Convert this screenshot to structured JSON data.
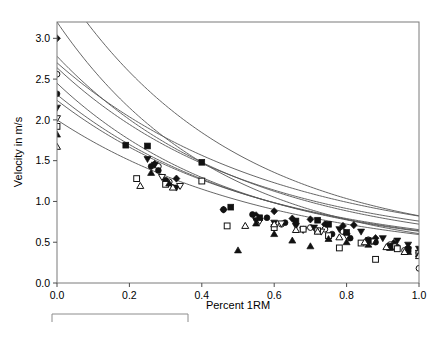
{
  "chart_data": {
    "type": "scatter",
    "title": "",
    "xlabel": "Percent 1RM",
    "ylabel": "Velocity in m/s",
    "xlim": [
      0.0,
      1.0
    ],
    "ylim": [
      0.0,
      3.2
    ],
    "xticks": [
      "0.0",
      "0.2",
      "0.4",
      "0.6",
      "0.8",
      "1.0"
    ],
    "xtick_values": [
      0.0,
      0.2,
      0.4,
      0.6,
      0.8,
      1.0
    ],
    "yticks": [
      "0.0",
      "0.5",
      "1.0",
      "1.5",
      "2.0",
      "2.5",
      "3.0"
    ],
    "ytick_values": [
      0.0,
      0.5,
      1.0,
      1.5,
      2.0,
      2.5,
      3.0
    ],
    "grid": false,
    "legend_position": "none",
    "legend_box_empty": true,
    "marker_color": "#111111",
    "curve_color": "#555555",
    "frame_color": "#7a7a7a",
    "series": [
      {
        "name": "Series 1",
        "marker": "filled-diamond",
        "fit": {
          "form": "exponential",
          "a": 3.3,
          "b": 2.1,
          "c": 0.42
        },
        "points": [
          [
            0.0,
            3.0
          ],
          [
            0.27,
            1.46
          ],
          [
            0.33,
            1.28
          ],
          [
            0.46,
            0.9
          ],
          [
            0.55,
            0.83
          ],
          [
            0.6,
            0.88
          ],
          [
            0.65,
            0.79
          ],
          [
            0.7,
            0.78
          ],
          [
            0.74,
            0.72
          ],
          [
            0.79,
            0.7
          ],
          [
            0.82,
            0.71
          ],
          [
            0.88,
            0.55
          ],
          [
            0.93,
            0.49
          ],
          [
            0.97,
            0.43
          ],
          [
            1.0,
            0.37
          ]
        ]
      },
      {
        "name": "Series 2",
        "marker": "open-circle",
        "fit": {
          "form": "exponential",
          "a": 2.9,
          "b": 2.25,
          "c": 0.3
        },
        "points": [
          [
            0.0,
            2.56
          ],
          [
            0.28,
            1.43
          ],
          [
            0.31,
            1.24
          ],
          [
            0.55,
            0.79
          ],
          [
            0.62,
            0.72
          ],
          [
            0.7,
            0.68
          ],
          [
            0.74,
            0.66
          ],
          [
            0.79,
            0.63
          ],
          [
            0.86,
            0.53
          ],
          [
            0.92,
            0.47
          ],
          [
            0.96,
            0.4
          ],
          [
            1.0,
            0.18
          ]
        ]
      },
      {
        "name": "Series 3",
        "marker": "filled-circle",
        "fit": {
          "form": "exponential",
          "a": 2.4,
          "b": 1.95,
          "c": 0.38
        },
        "points": [
          [
            0.0,
            2.32
          ],
          [
            0.26,
            1.43
          ],
          [
            0.28,
            1.38
          ],
          [
            0.3,
            1.26
          ],
          [
            0.46,
            0.9
          ],
          [
            0.54,
            0.84
          ],
          [
            0.58,
            0.8
          ],
          [
            0.63,
            0.74
          ],
          [
            0.68,
            0.66
          ],
          [
            0.72,
            0.64
          ],
          [
            0.76,
            0.6
          ],
          [
            0.81,
            0.55
          ],
          [
            0.88,
            0.5
          ],
          [
            0.94,
            0.44
          ],
          [
            1.0,
            0.36
          ]
        ]
      },
      {
        "name": "Series 4",
        "marker": "filled-triangle-down",
        "fit": {
          "form": "exponential",
          "a": 2.22,
          "b": 1.88,
          "c": 0.42
        },
        "points": [
          [
            0.0,
            2.15
          ],
          [
            0.25,
            1.52
          ],
          [
            0.27,
            1.45
          ],
          [
            0.33,
            1.17
          ],
          [
            0.55,
            0.77
          ],
          [
            0.6,
            0.74
          ],
          [
            0.66,
            0.7
          ],
          [
            0.71,
            0.68
          ],
          [
            0.78,
            0.66
          ],
          [
            0.84,
            0.63
          ],
          [
            0.9,
            0.55
          ],
          [
            0.94,
            0.52
          ],
          [
            0.97,
            0.47
          ],
          [
            1.0,
            0.42
          ]
        ]
      },
      {
        "name": "Series 5",
        "marker": "open-triangle-down",
        "fit": {
          "form": "exponential",
          "a": 2.1,
          "b": 2.0,
          "c": 0.35
        },
        "points": [
          [
            0.0,
            2.02
          ],
          [
            0.29,
            1.3
          ],
          [
            0.34,
            1.19
          ],
          [
            0.56,
            0.76
          ],
          [
            0.62,
            0.73
          ],
          [
            0.68,
            0.65
          ],
          [
            0.73,
            0.63
          ],
          [
            0.8,
            0.58
          ],
          [
            0.87,
            0.51
          ],
          [
            0.93,
            0.45
          ],
          [
            1.0,
            0.37
          ]
        ]
      },
      {
        "name": "Series 6",
        "marker": "filled-square",
        "fit": {
          "form": "exponential",
          "a": 2.3,
          "b": 1.7,
          "c": 0.4
        },
        "points": [
          [
            0.19,
            1.69
          ],
          [
            0.25,
            1.68
          ],
          [
            0.4,
            1.48
          ],
          [
            0.48,
            0.93
          ],
          [
            0.56,
            0.8
          ],
          [
            0.66,
            0.76
          ],
          [
            0.72,
            0.77
          ],
          [
            0.75,
            0.72
          ],
          [
            0.8,
            0.62
          ],
          [
            0.86,
            0.52
          ],
          [
            0.92,
            0.45
          ],
          [
            0.97,
            0.41
          ]
        ]
      },
      {
        "name": "Series 7",
        "marker": "open-square",
        "fit": {
          "form": "exponential",
          "a": 1.98,
          "b": 1.85,
          "c": 0.33
        },
        "points": [
          [
            0.0,
            1.92
          ],
          [
            0.22,
            1.28
          ],
          [
            0.3,
            1.21
          ],
          [
            0.4,
            1.25
          ],
          [
            0.47,
            0.7
          ],
          [
            0.6,
            0.68
          ],
          [
            0.68,
            0.66
          ],
          [
            0.72,
            0.64
          ],
          [
            0.75,
            0.58
          ],
          [
            0.78,
            0.43
          ],
          [
            0.84,
            0.49
          ],
          [
            0.88,
            0.29
          ],
          [
            0.94,
            0.42
          ],
          [
            1.0,
            0.36
          ]
        ]
      },
      {
        "name": "Series 8",
        "marker": "filled-triangle-up",
        "fit": {
          "form": "exponential",
          "a": 1.9,
          "b": 1.8,
          "c": 0.34
        },
        "points": [
          [
            0.0,
            1.82
          ],
          [
            0.26,
            1.35
          ],
          [
            0.31,
            1.22
          ],
          [
            0.5,
            0.4
          ],
          [
            0.55,
            0.73
          ],
          [
            0.6,
            0.6
          ],
          [
            0.65,
            0.52
          ],
          [
            0.7,
            0.45
          ],
          [
            0.75,
            0.54
          ],
          [
            0.8,
            0.5
          ],
          [
            0.86,
            0.47
          ],
          [
            0.92,
            0.43
          ],
          [
            0.97,
            0.38
          ],
          [
            1.0,
            0.35
          ]
        ]
      },
      {
        "name": "Series 9",
        "marker": "open-triangle-up",
        "fit": {
          "form": "exponential",
          "a": 1.72,
          "b": 1.7,
          "c": 0.28
        },
        "points": [
          [
            0.0,
            1.67
          ],
          [
            0.23,
            1.19
          ],
          [
            0.32,
            1.17
          ],
          [
            0.52,
            0.7
          ],
          [
            0.6,
            0.72
          ],
          [
            0.66,
            0.65
          ],
          [
            0.72,
            0.63
          ],
          [
            0.78,
            0.56
          ],
          [
            0.85,
            0.5
          ],
          [
            0.91,
            0.44
          ],
          [
            0.96,
            0.38
          ],
          [
            1.0,
            0.33
          ]
        ]
      }
    ]
  }
}
